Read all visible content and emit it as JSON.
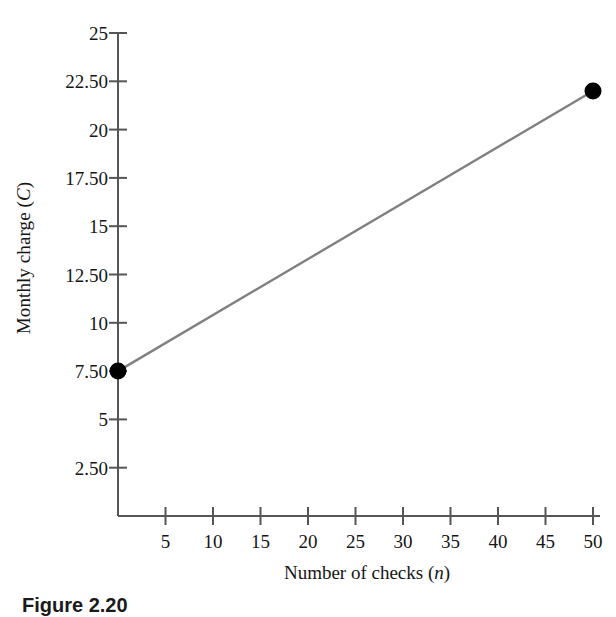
{
  "chart_data": {
    "type": "line",
    "title": "",
    "subtitle": "",
    "xlabel": "Number of checks (n)",
    "xlabel_text": "Number of checks (",
    "xlabel_var": "n",
    "xlabel_close": ")",
    "ylabel": "Monthly charge (C)",
    "ylabel_text": "Monthly charge (",
    "ylabel_var": "C",
    "ylabel_close": ")",
    "x": [
      0,
      50
    ],
    "values": [
      7.5,
      22.0
    ],
    "series": [
      {
        "name": "Monthly charge",
        "x": [
          0,
          50
        ],
        "values": [
          7.5,
          22.0
        ]
      }
    ],
    "xlim": [
      0,
      52.5
    ],
    "ylim": [
      0,
      25
    ],
    "xticks": [
      5,
      10,
      15,
      20,
      25,
      30,
      35,
      40,
      45,
      50
    ],
    "xtick_labels": [
      "5",
      "10",
      "15",
      "20",
      "25",
      "30",
      "35",
      "40",
      "45",
      "50"
    ],
    "yticks": [
      2.5,
      5,
      7.5,
      10,
      12.5,
      15,
      17.5,
      20,
      22.5,
      25
    ],
    "ytick_labels": [
      "2.50",
      "5",
      "7.50",
      "10",
      "12.50",
      "15",
      "17.50",
      "20",
      "22.50",
      "25"
    ],
    "grid": false,
    "legend": false,
    "legend_position": "none",
    "line_color": "#808080",
    "marker_color": "#000000",
    "axis_color": "#555555",
    "background_color": "#ffffff",
    "markers": [
      {
        "x": 0,
        "y": 7.5,
        "label": ""
      },
      {
        "x": 50,
        "y": 22.0,
        "label": ""
      }
    ],
    "annotations": []
  },
  "caption": {
    "text": "Figure 2.20"
  }
}
